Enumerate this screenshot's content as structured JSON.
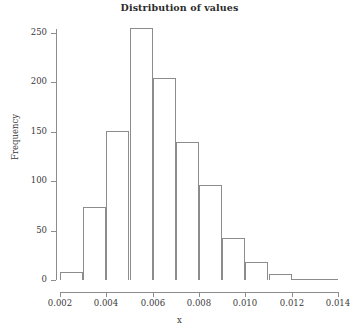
{
  "chart_data": {
    "type": "bar",
    "title": "Distribution of values",
    "xlabel": "x",
    "ylabel": "Frequency",
    "xlim": [
      0.002,
      0.014
    ],
    "ylim": [
      0,
      255
    ],
    "grid": false,
    "legend": null,
    "bin_width": 0.001,
    "bin_edges": [
      0.002,
      0.003,
      0.004,
      0.005,
      0.006,
      0.007,
      0.008,
      0.009,
      0.01,
      0.011,
      0.012,
      0.013,
      0.014
    ],
    "categories": [
      "0.002-0.003",
      "0.003-0.004",
      "0.004-0.005",
      "0.005-0.006",
      "0.006-0.007",
      "0.007-0.008",
      "0.008-0.009",
      "0.009-0.010",
      "0.010-0.011",
      "0.011-0.012",
      "0.012-0.013",
      "0.013-0.014"
    ],
    "values": [
      8,
      74,
      151,
      255,
      204,
      140,
      96,
      43,
      18,
      6,
      1,
      1
    ],
    "xticks": [
      0.002,
      0.004,
      0.006,
      0.008,
      0.01,
      0.012,
      0.014
    ],
    "xtick_labels": [
      "0.002",
      "0.004",
      "0.006",
      "0.008",
      "0.010",
      "0.012",
      "0.014"
    ],
    "yticks": [
      0,
      50,
      100,
      150,
      200,
      250
    ],
    "ytick_labels": [
      "0",
      "50",
      "100",
      "150",
      "200",
      "250"
    ],
    "bar_edge_color": "#8c8c8c",
    "bar_fill_color": "#ffffff",
    "axis_color": "#8c8c8c",
    "text_color": "#3a3a3a"
  }
}
